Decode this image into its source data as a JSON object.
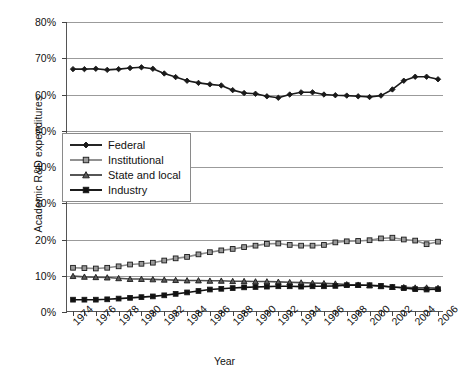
{
  "chart_data": {
    "type": "line",
    "title": "",
    "xlabel": "Year",
    "ylabel": "Academic R&D expenditures",
    "ylim": [
      0,
      80
    ],
    "yunit": "%",
    "ytick_labels": [
      "0%",
      "10%",
      "20%",
      "30%",
      "40%",
      "50%",
      "60%",
      "70%",
      "80%"
    ],
    "ytick_values": [
      0,
      10,
      20,
      30,
      40,
      50,
      60,
      70,
      80
    ],
    "grid": "horizontal",
    "legend_position": "center-left",
    "x": [
      1974,
      1975,
      1976,
      1977,
      1978,
      1979,
      1980,
      1981,
      1982,
      1983,
      1984,
      1985,
      1986,
      1987,
      1988,
      1989,
      1990,
      1991,
      1992,
      1993,
      1994,
      1995,
      1996,
      1997,
      1998,
      1999,
      2000,
      2001,
      2002,
      2003,
      2004,
      2005,
      2006
    ],
    "xtick_labels": [
      "1974",
      "1976",
      "1978",
      "1980",
      "1982",
      "1984",
      "1986",
      "1988",
      "1990",
      "1992",
      "1994",
      "1996",
      "1998",
      "2000",
      "2002",
      "2004",
      "2006"
    ],
    "xtick_values": [
      1974,
      1976,
      1978,
      1980,
      1982,
      1984,
      1986,
      1988,
      1990,
      1992,
      1994,
      1996,
      1998,
      2000,
      2002,
      2004,
      2006
    ],
    "series": [
      {
        "name": "Federal",
        "marker": "diamond",
        "color": "#1a1a1a",
        "marker_fill": "#1a1a1a",
        "values": [
          67.0,
          67.0,
          67.1,
          66.8,
          67.0,
          67.3,
          67.5,
          67.1,
          65.8,
          64.8,
          63.8,
          63.2,
          62.8,
          62.5,
          61.2,
          60.4,
          60.2,
          59.5,
          59.1,
          60.0,
          60.6,
          60.6,
          60.0,
          59.8,
          59.7,
          59.5,
          59.3,
          59.7,
          61.4,
          63.8,
          64.9,
          64.9,
          64.2
        ]
      },
      {
        "name": "Institutional",
        "marker": "square",
        "color": "#8c8c8c",
        "marker_fill": "#9a9a9a",
        "values": [
          12.2,
          12.1,
          12.0,
          12.2,
          12.6,
          13.1,
          13.3,
          13.6,
          14.2,
          14.8,
          15.2,
          15.9,
          16.5,
          17.0,
          17.4,
          17.9,
          18.3,
          18.8,
          18.9,
          18.5,
          18.3,
          18.3,
          18.5,
          19.2,
          19.5,
          19.6,
          19.8,
          20.3,
          20.5,
          20.0,
          19.7,
          18.7,
          19.4
        ]
      },
      {
        "name": "State and local",
        "marker": "triangle",
        "color": "#4d4d4d",
        "marker_fill": "#5a5a5a",
        "values": [
          9.9,
          9.7,
          9.6,
          9.5,
          9.3,
          9.1,
          9.1,
          9.0,
          8.9,
          8.8,
          8.7,
          8.7,
          8.6,
          8.6,
          8.5,
          8.5,
          8.4,
          8.4,
          8.3,
          8.2,
          8.1,
          8.0,
          7.9,
          7.8,
          7.6,
          7.5,
          7.3,
          7.1,
          6.9,
          6.8,
          6.7,
          6.7,
          6.6
        ]
      },
      {
        "name": "Industry",
        "marker": "square",
        "color": "#111111",
        "marker_fill": "#111111",
        "values": [
          3.4,
          3.4,
          3.4,
          3.5,
          3.7,
          3.9,
          4.1,
          4.3,
          4.6,
          5.0,
          5.4,
          5.8,
          6.2,
          6.4,
          6.6,
          6.8,
          6.9,
          7.0,
          7.1,
          7.1,
          7.0,
          7.1,
          7.1,
          7.2,
          7.4,
          7.4,
          7.4,
          7.2,
          6.9,
          6.6,
          6.3,
          6.2,
          6.3
        ]
      }
    ]
  }
}
